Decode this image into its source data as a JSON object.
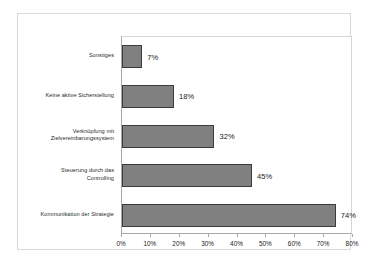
{
  "chart_data": {
    "type": "bar",
    "orientation": "horizontal",
    "title": "",
    "xlabel": "",
    "ylabel": "",
    "xlim": [
      0,
      80
    ],
    "xticks": [
      "0%",
      "10%",
      "20%",
      "30%",
      "40%",
      "50%",
      "60%",
      "70%",
      "80%"
    ],
    "xtick_values": [
      0,
      10,
      20,
      30,
      40,
      50,
      60,
      70,
      80
    ],
    "grid": false,
    "legend": false,
    "categories": [
      "Sonstiges",
      "Keine aktive Sicherstellung",
      "Verknüpfung mit\nZielvereinbarungssystem",
      "Steuerung durch das\nControlling",
      "Kommunikation der Strategie"
    ],
    "values": [
      7,
      18,
      32,
      45,
      74
    ],
    "data_labels": [
      "7%",
      "18%",
      "32%",
      "45%",
      "74%"
    ],
    "colors": {
      "bar_fill": "#808080",
      "bar_border": "#3b3b3b",
      "plot_background": "#ffffff",
      "axis_line": "#a8a8a8",
      "frame_border": "#d8d8d8",
      "text": "#1a1a1a"
    }
  }
}
